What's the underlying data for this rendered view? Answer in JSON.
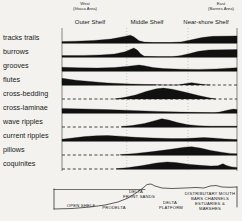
{
  "figure": {
    "west_direction": "West",
    "west_area": "(Ithaca Area)",
    "east_direction": "East",
    "east_area": "(Barnes Area)",
    "ink_color": "#1a1a1a",
    "paper_color": "#f3f2ee"
  },
  "chart_data": {
    "type": "area",
    "title": "",
    "xlabel": "",
    "ylabel": "",
    "x_unit": "percent of shelf transect (west to east)",
    "y_unit": "relative abundance (0-10)",
    "zones": [
      "Outer Shelf",
      "Middle  Shelf",
      "Near-shore  Shelf"
    ],
    "zone_header_centers_pct": [
      16,
      48,
      82
    ],
    "zone_divider_pct": [
      37,
      72
    ],
    "rows": [
      {
        "label": "tracks trails",
        "baseline": [
          {
            "from": 0,
            "to": 100,
            "style": "solid"
          }
        ],
        "profile": [
          [
            0,
            1.2
          ],
          [
            8,
            1.6
          ],
          [
            18,
            2.2
          ],
          [
            28,
            3.5
          ],
          [
            35,
            5.5
          ],
          [
            39,
            6.8
          ],
          [
            41,
            5.5
          ],
          [
            44,
            2.0
          ],
          [
            47,
            0.8
          ],
          [
            52,
            0.4
          ],
          [
            62,
            0.4
          ],
          [
            68,
            1.0
          ],
          [
            74,
            2.8
          ],
          [
            80,
            4.8
          ],
          [
            86,
            5.8
          ],
          [
            100,
            6.2
          ]
        ]
      },
      {
        "label": "burrows",
        "baseline": [
          {
            "from": 0,
            "to": 100,
            "style": "solid"
          }
        ],
        "profile": [
          [
            0,
            1.2
          ],
          [
            12,
            1.4
          ],
          [
            22,
            1.8
          ],
          [
            30,
            2.6
          ],
          [
            36,
            4.5
          ],
          [
            41,
            7.8
          ],
          [
            43,
            6.0
          ],
          [
            45,
            2.5
          ],
          [
            47,
            0.6
          ],
          [
            55,
            0.3
          ],
          [
            63,
            0.3
          ],
          [
            68,
            1.2
          ],
          [
            73,
            3.0
          ],
          [
            78,
            5.0
          ],
          [
            84,
            6.2
          ],
          [
            100,
            6.5
          ]
        ]
      },
      {
        "label": "grooves",
        "baseline": [
          {
            "from": 0,
            "to": 100,
            "style": "solid"
          }
        ],
        "profile": [
          [
            0,
            3.2
          ],
          [
            10,
            2.8
          ],
          [
            20,
            2.6
          ],
          [
            30,
            3.0
          ],
          [
            38,
            4.2
          ],
          [
            44,
            5.2
          ],
          [
            47,
            4.5
          ],
          [
            52,
            3.0
          ],
          [
            58,
            2.2
          ],
          [
            68,
            1.6
          ],
          [
            78,
            1.4
          ],
          [
            88,
            1.8
          ],
          [
            95,
            2.4
          ],
          [
            100,
            2.8
          ]
        ]
      },
      {
        "label": "flutes",
        "baseline": [
          {
            "from": 0,
            "to": 52,
            "style": "solid"
          },
          {
            "from": 52,
            "to": 100,
            "style": "dashed"
          }
        ],
        "profile": [
          [
            0,
            5.8
          ],
          [
            8,
            4.2
          ],
          [
            16,
            3.0
          ],
          [
            26,
            1.8
          ],
          [
            36,
            1.0
          ],
          [
            46,
            0.5
          ],
          [
            54,
            0.2
          ],
          [
            58,
            0
          ],
          [
            66,
            0
          ],
          [
            70,
            1.0
          ],
          [
            74,
            2.0
          ],
          [
            78,
            1.0
          ],
          [
            82,
            0.3
          ],
          [
            85,
            0
          ]
        ]
      },
      {
        "label": "cross-bedding",
        "baseline": [
          {
            "from": 0,
            "to": 100,
            "style": "dashed"
          }
        ],
        "profile": [
          [
            30,
            0
          ],
          [
            36,
            1.5
          ],
          [
            42,
            3.5
          ],
          [
            48,
            6.5
          ],
          [
            54,
            9.0
          ],
          [
            58,
            9.5
          ],
          [
            63,
            8.5
          ],
          [
            70,
            6.0
          ],
          [
            78,
            3.0
          ],
          [
            84,
            1.0
          ],
          [
            88,
            0
          ]
        ]
      },
      {
        "label": "cross-laminae",
        "baseline": [
          {
            "from": 0,
            "to": 100,
            "style": "solid"
          }
        ],
        "profile": [
          [
            0,
            4.0
          ],
          [
            12,
            3.6
          ],
          [
            25,
            3.0
          ],
          [
            40,
            2.2
          ],
          [
            55,
            1.4
          ],
          [
            68,
            0.8
          ],
          [
            80,
            0.4
          ],
          [
            87,
            0.3
          ],
          [
            90,
            0.8
          ],
          [
            95,
            2.6
          ],
          [
            98,
            3.4
          ],
          [
            100,
            3.0
          ]
        ]
      },
      {
        "label": "wave ripples",
        "baseline": [
          {
            "from": 0,
            "to": 34,
            "style": "dashed"
          },
          {
            "from": 34,
            "to": 100,
            "style": "solid"
          }
        ],
        "profile": [
          [
            34,
            0.4
          ],
          [
            40,
            1.2
          ],
          [
            47,
            3.0
          ],
          [
            53,
            5.5
          ],
          [
            57,
            7.2
          ],
          [
            61,
            6.0
          ],
          [
            66,
            3.8
          ],
          [
            72,
            2.0
          ],
          [
            78,
            1.0
          ],
          [
            85,
            0.7
          ],
          [
            100,
            0.7
          ]
        ]
      },
      {
        "label": "current ripples",
        "baseline": [
          {
            "from": 0,
            "to": 100,
            "style": "solid"
          }
        ],
        "profile": [
          [
            0,
            1.6
          ],
          [
            6,
            2.6
          ],
          [
            13,
            3.8
          ],
          [
            20,
            4.6
          ],
          [
            26,
            4.8
          ],
          [
            33,
            4.2
          ],
          [
            42,
            3.2
          ],
          [
            52,
            2.6
          ],
          [
            62,
            2.2
          ],
          [
            70,
            2.2
          ],
          [
            76,
            2.6
          ],
          [
            81,
            3.0
          ],
          [
            86,
            2.6
          ],
          [
            93,
            1.8
          ],
          [
            100,
            1.2
          ]
        ]
      },
      {
        "label": "pillows",
        "baseline": [
          {
            "from": 0,
            "to": 34,
            "style": "dashed"
          },
          {
            "from": 34,
            "to": 100,
            "style": "solid"
          }
        ],
        "profile": [
          [
            33,
            0.3
          ],
          [
            42,
            1.4
          ],
          [
            52,
            3.0
          ],
          [
            62,
            5.0
          ],
          [
            70,
            6.8
          ],
          [
            74,
            7.2
          ],
          [
            79,
            6.0
          ],
          [
            85,
            4.0
          ],
          [
            91,
            2.4
          ],
          [
            96,
            1.4
          ],
          [
            100,
            1.0
          ]
        ]
      },
      {
        "label": "coquinites",
        "baseline": [
          {
            "from": 0,
            "to": 32,
            "style": "dashed"
          },
          {
            "from": 32,
            "to": 100,
            "style": "solid"
          }
        ],
        "profile": [
          [
            31,
            0.3
          ],
          [
            38,
            1.2
          ],
          [
            46,
            3.0
          ],
          [
            54,
            5.2
          ],
          [
            60,
            6.2
          ],
          [
            65,
            5.6
          ],
          [
            72,
            4.2
          ],
          [
            79,
            3.2
          ],
          [
            85,
            2.6
          ],
          [
            89,
            2.8
          ],
          [
            92,
            4.6
          ],
          [
            94,
            3.0
          ],
          [
            97,
            1.8
          ],
          [
            100,
            1.4
          ]
        ]
      }
    ]
  },
  "cross_section": {
    "labels": [
      {
        "text": "OPEN SHELF",
        "x": 81,
        "y": 207
      },
      {
        "text": "PRODELTA",
        "x": 114,
        "y": 209
      },
      {
        "text": "DELTA",
        "x": 136,
        "y": 193
      },
      {
        "text": "FRONT SANDS",
        "x": 139,
        "y": 198
      },
      {
        "text": "DELTA",
        "x": 170,
        "y": 204
      },
      {
        "text": "PLATFORM",
        "x": 171,
        "y": 209
      },
      {
        "text": "DISTRIBUTARY MOUTH",
        "x": 210,
        "y": 195
      },
      {
        "text": "BARS CHANNELS",
        "x": 210,
        "y": 200
      },
      {
        "text": "ESTUARIES &",
        "x": 210,
        "y": 205
      },
      {
        "text": "MARSHES",
        "x": 210,
        "y": 210
      }
    ],
    "left_edge": [
      [
        54,
        189
      ],
      [
        54,
        209
      ]
    ],
    "right_edge": [
      [
        237,
        187
      ],
      [
        237,
        207
      ]
    ],
    "water_line": [
      [
        54,
        189.5
      ],
      [
        145,
        189.5
      ]
    ],
    "floor": [
      [
        54,
        209
      ],
      [
        72,
        208.5
      ],
      [
        90,
        207
      ],
      [
        105,
        205
      ],
      [
        118,
        202
      ],
      [
        128,
        198
      ],
      [
        136,
        193
      ],
      [
        143,
        188
      ],
      [
        147,
        184.5
      ],
      [
        151,
        184
      ],
      [
        155,
        186
      ],
      [
        162,
        188
      ],
      [
        172,
        188.5
      ],
      [
        185,
        188
      ],
      [
        196,
        187.5
      ],
      [
        204,
        188
      ],
      [
        210,
        186
      ],
      [
        216,
        185.5
      ],
      [
        222,
        187
      ],
      [
        230,
        187.3
      ],
      [
        237,
        187
      ]
    ]
  }
}
